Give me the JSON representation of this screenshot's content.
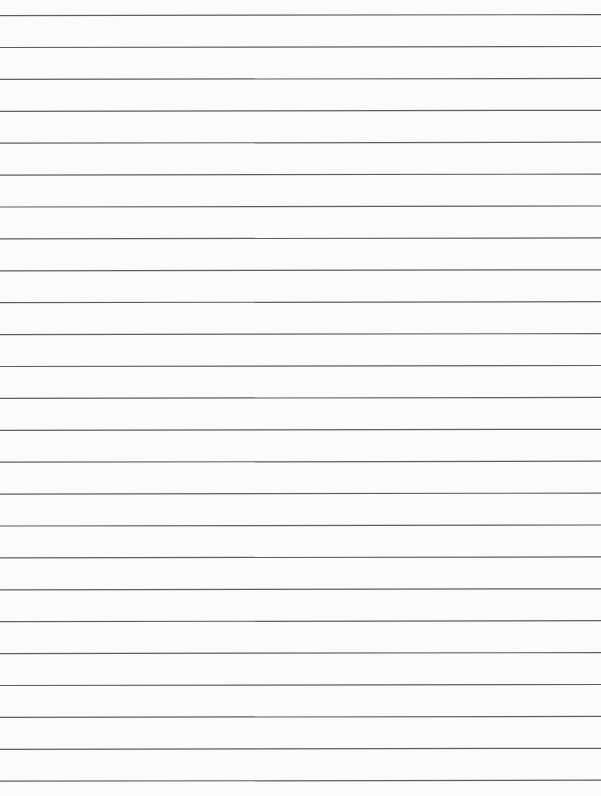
{
  "page": {
    "type": "blank lined paper",
    "background_color": "#fbfbfb",
    "line_color": "#5e5e5e",
    "line_count": 25,
    "first_line_y": 15.6,
    "line_spacing": 31.9,
    "line_thickness": 1.2,
    "line_tilt_px": -1.0,
    "text": ""
  }
}
